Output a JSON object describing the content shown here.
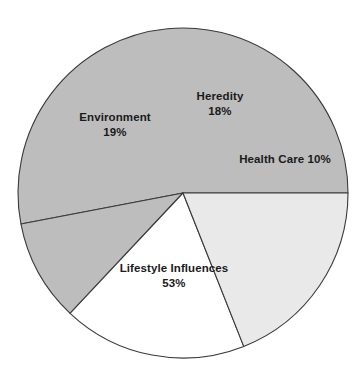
{
  "chart_data": {
    "type": "pie",
    "title": "",
    "subtitle": "",
    "xlabel": "",
    "ylabel": "",
    "legend_position": "none",
    "grid": false,
    "labels_inside_slices": true,
    "total_percent": 100,
    "categories": [
      "Lifestyle Influences",
      "Health Care",
      "Heredity",
      "Environment"
    ],
    "values": [
      53,
      10,
      18,
      19
    ],
    "slices": [
      {
        "name": "Lifestyle Influences",
        "label": "Lifestyle Influences",
        "value": 53,
        "value_label": "53%",
        "color": "#bdbdbd",
        "label_layout": "two-line",
        "label_x": 174,
        "label_y": 272
      },
      {
        "name": "Health Care",
        "label": "Health Care 10%",
        "value": 10,
        "value_label": "10%",
        "color": "#bdbdbd",
        "label_layout": "one-line",
        "label_x": 285,
        "label_y": 163
      },
      {
        "name": "Heredity",
        "label": "Heredity",
        "value": 18,
        "value_label": "18%",
        "color": "#ffffff",
        "label_layout": "two-line",
        "label_x": 220,
        "label_y": 100
      },
      {
        "name": "Environment",
        "label": "Environment",
        "value": 19,
        "value_label": "19%",
        "color": "#e9e9e9",
        "label_layout": "two-line",
        "label_x": 115,
        "label_y": 121
      }
    ],
    "geometry": {
      "center_x": 183,
      "center_y": 193,
      "radius": 165,
      "start_angle_deg": 0,
      "direction": "counterclockwise"
    },
    "colors": {
      "outline": "#3a3a3a",
      "label_text": "#1a1a1a",
      "background": "#ffffff"
    }
  }
}
